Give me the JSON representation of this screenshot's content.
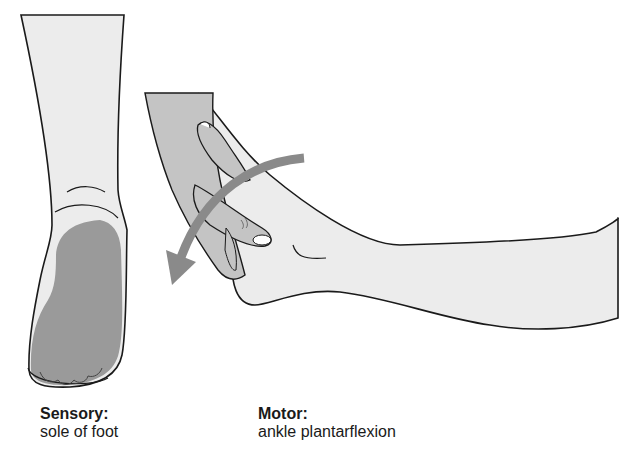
{
  "figure": {
    "panels": [
      {
        "id": "sensory",
        "illustration": "posterior view of lower leg and foot with sole shaded",
        "label_title": "Sensory:",
        "label_desc": "sole of foot"
      },
      {
        "id": "motor",
        "illustration": "lateral view of foot with examiner hand, curved arrow showing plantarflexion",
        "label_title": "Motor:",
        "label_desc": "ankle plantarflexion"
      }
    ],
    "colors": {
      "skin": "#ececec",
      "shaded_area": "#9a9a9a",
      "hand": "#c4c4c4",
      "arrow": "#8a8a8a",
      "outline": "#1a1a1a"
    }
  }
}
